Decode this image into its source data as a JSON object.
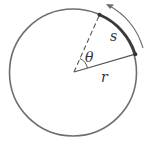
{
  "diagram": {
    "labels": {
      "arc": "s",
      "angle": "θ",
      "radius": "r"
    },
    "colors": {
      "stroke": "#6e6e6e",
      "arc": "#3a3a3a",
      "text": "#333333",
      "background": "#ffffff"
    }
  }
}
